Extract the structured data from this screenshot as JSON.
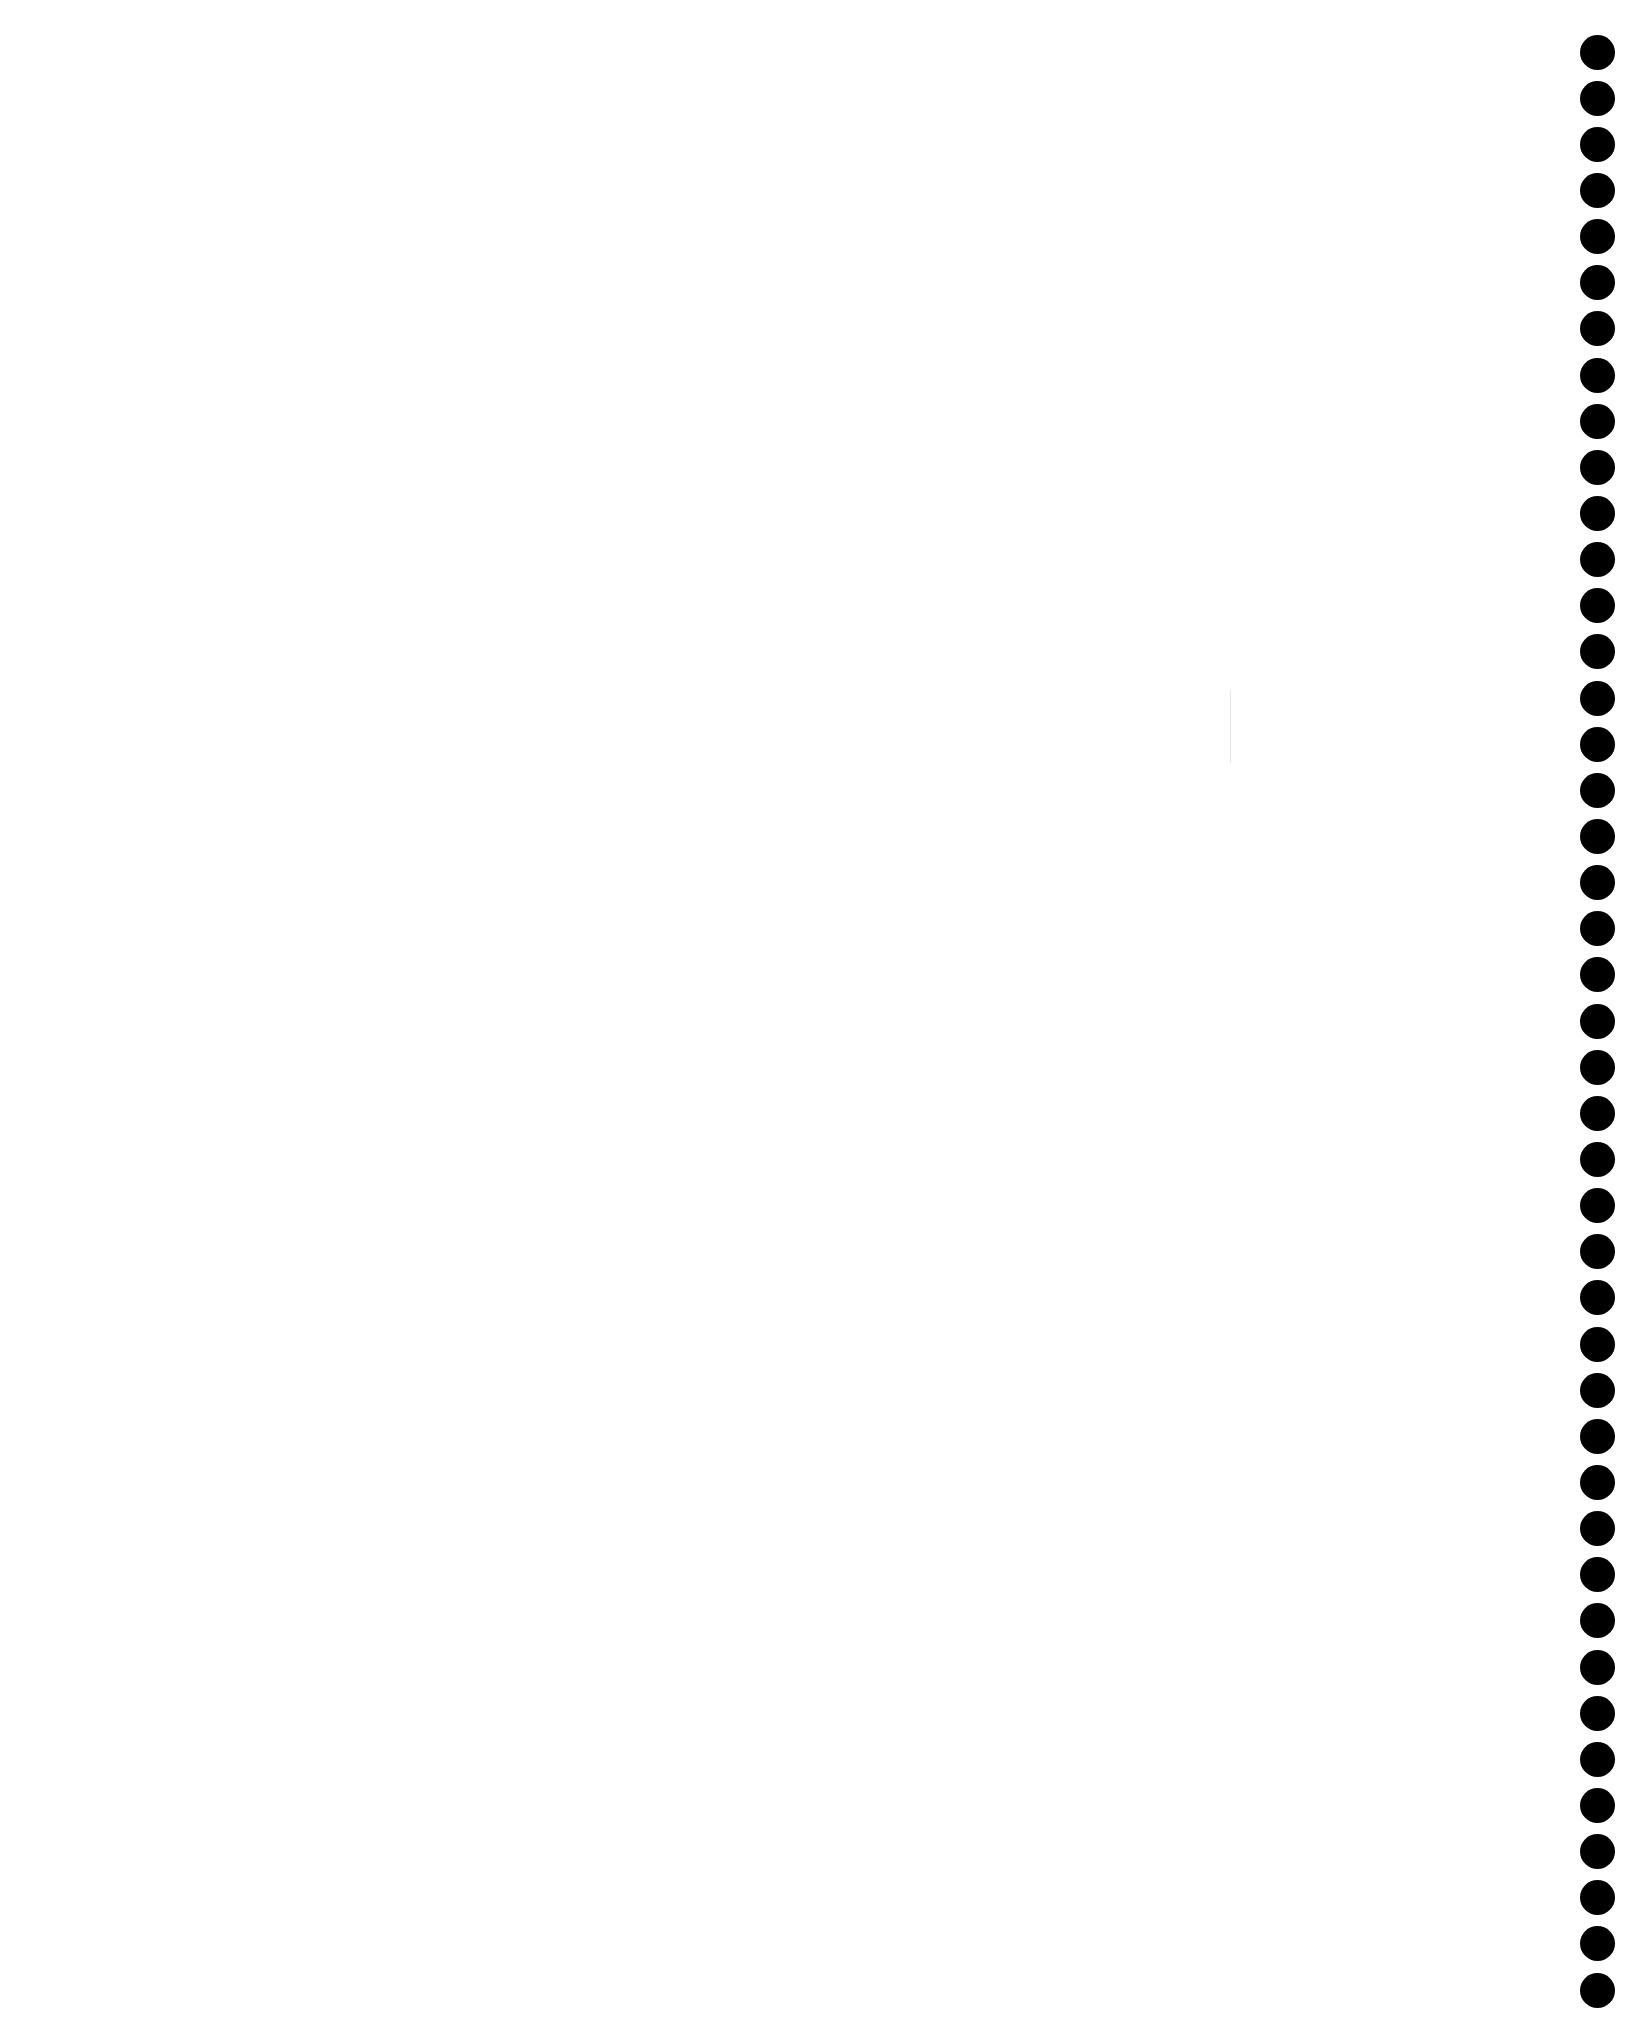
{
  "page": {
    "background_color": "#ffffff",
    "content": ""
  },
  "binding": {
    "hole_count": 43,
    "hole_color": "#000000",
    "hole_diameter": 35,
    "first_center_y": 52,
    "last_center_y": 1990,
    "center_x": 1597
  },
  "artifacts": {
    "faint_vertical_mark_color": "#e6e6e6"
  }
}
